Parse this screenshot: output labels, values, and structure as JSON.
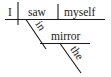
{
  "diagram": {
    "type": "Reed-Kellogg sentence diagram",
    "sentence_words": {
      "subject": "I",
      "verb": "saw",
      "direct_object": "myself",
      "preposition": "in",
      "prepositional_object": "mirror",
      "article": "the"
    },
    "colors": {
      "ink": "#1a1a1a",
      "background": "#ffffff"
    }
  }
}
